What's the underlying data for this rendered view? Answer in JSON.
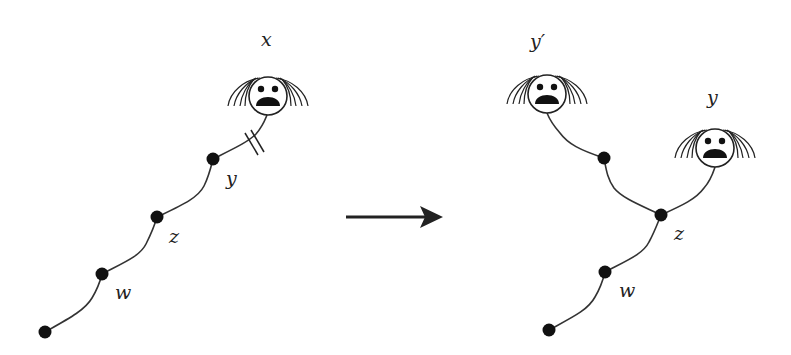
{
  "diagram": {
    "type": "tree-transformation",
    "left": {
      "labels": {
        "x": "x",
        "y": "y",
        "z": "z",
        "w": "w"
      },
      "nodes": [
        {
          "id": "bottom",
          "x": 45,
          "y": 332
        },
        {
          "id": "w",
          "x": 102,
          "y": 274
        },
        {
          "id": "z",
          "x": 157,
          "y": 217
        },
        {
          "id": "y",
          "x": 213,
          "y": 159
        }
      ],
      "face": {
        "id": "x",
        "cx": 268,
        "cy": 96
      },
      "cut_marker": "double-slash on edge y–x"
    },
    "arrow": {
      "direction": "right"
    },
    "right": {
      "labels": {
        "y_prime": "y′",
        "y": "y",
        "z": "z",
        "w": "w"
      },
      "nodes": [
        {
          "id": "bottom",
          "x": 549,
          "y": 330
        },
        {
          "id": "w",
          "x": 605,
          "y": 272
        },
        {
          "id": "z",
          "x": 661,
          "y": 215
        },
        {
          "id": "branch",
          "x": 604,
          "y": 158
        }
      ],
      "faces": [
        {
          "id": "y_prime",
          "cx": 547,
          "cy": 94
        },
        {
          "id": "y",
          "cx": 715,
          "cy": 148
        }
      ]
    }
  }
}
